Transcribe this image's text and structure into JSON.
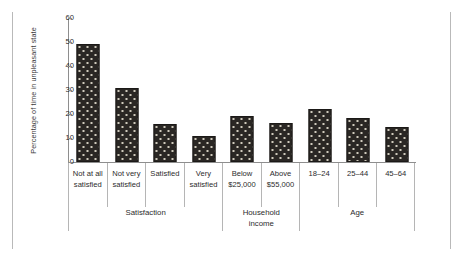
{
  "chart_data": {
    "type": "bar",
    "title": "",
    "xlabel": "",
    "ylabel": "Percentage of time in unpleasant state",
    "ylim": [
      0,
      60
    ],
    "yticks": [
      "0",
      "10",
      "20",
      "30",
      "40",
      "50",
      "60"
    ],
    "grid": false,
    "legend": null,
    "categories": [
      "Not at all satisfied",
      "Not very satisfied",
      "Satisfied",
      "Very satisfied",
      "Below $25,000",
      "Above $55,000",
      "18–24",
      "25–44",
      "45–64"
    ],
    "values": [
      49,
      31,
      16,
      11,
      19,
      16.3,
      22,
      18.5,
      14.5
    ],
    "groups": [
      {
        "name": "Satisfaction",
        "categories": [
          "Not at all satisfied",
          "Not very satisfied",
          "Satisfied",
          "Very satisfied"
        ]
      },
      {
        "name": "Household income",
        "categories": [
          "Below $25,000",
          "Above $55,000"
        ]
      },
      {
        "name": "Age",
        "categories": [
          "18–24",
          "25–44",
          "45–64"
        ]
      }
    ],
    "bar_color": "#2a2724",
    "bar_pattern": "dotted-dark"
  },
  "axis": {
    "y_title": "Percentage of time in unpleasant state",
    "ticks": [
      {
        "label": "60",
        "value": 60
      },
      {
        "label": "50",
        "value": 50
      },
      {
        "label": "40",
        "value": 40
      },
      {
        "label": "30",
        "value": 30
      },
      {
        "label": "20",
        "value": 20
      },
      {
        "label": "10",
        "value": 10
      },
      {
        "label": "0",
        "value": 0
      }
    ]
  },
  "category_labels": [
    {
      "line1": "Not at all",
      "line2": "satisfied"
    },
    {
      "line1": "Not very",
      "line2": "satisfied"
    },
    {
      "line1": "Satisfied",
      "line2": ""
    },
    {
      "line1": "Very",
      "line2": "satisfied"
    },
    {
      "line1": "Below",
      "line2": "$25,000"
    },
    {
      "line1": "Above",
      "line2": "$55,000"
    },
    {
      "line1": "18–24",
      "line2": ""
    },
    {
      "line1": "25–44",
      "line2": ""
    },
    {
      "line1": "45–64",
      "line2": ""
    }
  ],
  "group_labels": [
    {
      "line1": "Satisfaction",
      "line2": ""
    },
    {
      "line1": "Household",
      "line2": "income"
    },
    {
      "line1": "Age",
      "line2": ""
    }
  ]
}
